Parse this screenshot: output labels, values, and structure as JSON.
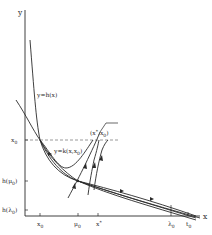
{
  "diagram": {
    "axes": {
      "x_label": "x",
      "y_label": "y"
    },
    "y_ticks": [
      {
        "label": "x",
        "sub": "0",
        "y": 140
      },
      {
        "label": "h(μ",
        "sub": "0",
        "tail": ")",
        "y": 181
      },
      {
        "label": "h(λ",
        "sub": "0",
        "tail": ")",
        "y": 210
      }
    ],
    "x_ticks": [
      {
        "label": "x",
        "sub": "0",
        "x": 40
      },
      {
        "label": "μ",
        "sub": "0",
        "x": 78
      },
      {
        "label": "x",
        "sup": "*",
        "x": 98
      },
      {
        "label": "λ",
        "sub": "0",
        "x": 171
      },
      {
        "label": "t",
        "sub": "0",
        "x": 188
      }
    ],
    "curve_labels": {
      "h_curve": "y=h(x)",
      "k_curve": "y=k(x,x",
      "k_curve_sub": "0",
      "k_curve_tail": ")",
      "point": "(x",
      "point_sup": "*",
      "point_mid": ",x",
      "point_sub": "0",
      "point_tail": ")"
    }
  }
}
